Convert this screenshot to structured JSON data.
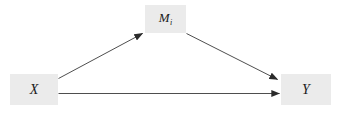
{
  "diagram": {
    "type": "mediation-path-diagram",
    "background_color": "#ffffff",
    "node_fill_color": "#ebebeb",
    "line_color": "#3a3a3a",
    "nodes": [
      {
        "id": "x",
        "label": "X",
        "subscript": ""
      },
      {
        "id": "m",
        "label": "M",
        "subscript": "i"
      },
      {
        "id": "y",
        "label": "Y",
        "subscript": ""
      }
    ],
    "edges": [
      {
        "id": "x-to-m",
        "from": "X",
        "to": "M",
        "label": ""
      },
      {
        "id": "m-to-y",
        "from": "M",
        "to": "Y",
        "label": ""
      },
      {
        "id": "x-to-y",
        "from": "X",
        "to": "Y",
        "label": ""
      }
    ]
  }
}
